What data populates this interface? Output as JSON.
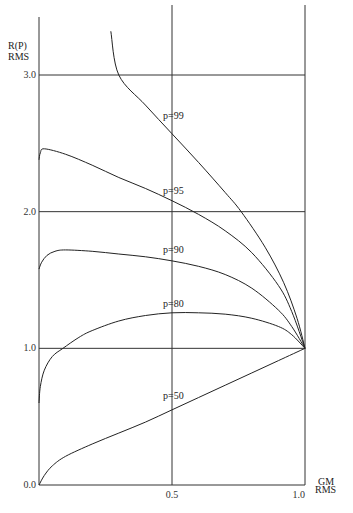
{
  "chart_data": {
    "type": "line",
    "title": "",
    "xlabel": "GM RMS",
    "xlabel_lines": [
      "GM",
      "RMS"
    ],
    "ylabel": "R(P) RMS",
    "ylabel_lines": [
      "R(P)",
      "RMS"
    ],
    "xlim": [
      0,
      1.0
    ],
    "ylim": [
      0,
      3.35
    ],
    "x_ticks": [
      {
        "value": 0.5,
        "label": "0.5"
      },
      {
        "value": 1.0,
        "label": "1.0"
      }
    ],
    "y_ticks": [
      {
        "value": 0.0,
        "label": "0.0"
      },
      {
        "value": 1.0,
        "label": "1.0"
      },
      {
        "value": 2.0,
        "label": "2.0"
      },
      {
        "value": 3.0,
        "label": "3.0"
      }
    ],
    "grid": true,
    "legend": "none (inline curve labels)",
    "series": [
      {
        "name": "p=99",
        "label": "p=99",
        "label_at": [
          0.5,
          2.68
        ],
        "x": [
          0.27,
          0.3,
          0.4,
          0.5,
          0.6,
          0.7,
          0.76,
          0.85,
          0.92,
          0.97,
          1.0
        ],
        "y": [
          3.32,
          3.0,
          2.78,
          2.57,
          2.36,
          2.14,
          2.0,
          1.74,
          1.48,
          1.22,
          1.0
        ]
      },
      {
        "name": "p=95",
        "label": "p=95",
        "label_at": [
          0.5,
          2.13
        ],
        "x": [
          0.0,
          0.005,
          0.02,
          0.1,
          0.2,
          0.3,
          0.4,
          0.5,
          0.6,
          0.7,
          0.8,
          0.9,
          0.95,
          1.0
        ],
        "y": [
          2.38,
          2.43,
          2.46,
          2.42,
          2.34,
          2.25,
          2.17,
          2.08,
          1.98,
          1.86,
          1.7,
          1.46,
          1.27,
          1.0
        ]
      },
      {
        "name": "p=90",
        "label": "p=90",
        "label_at": [
          0.5,
          1.7
        ],
        "x": [
          0.0,
          0.01,
          0.03,
          0.06,
          0.1,
          0.2,
          0.3,
          0.4,
          0.5,
          0.6,
          0.7,
          0.8,
          0.9,
          0.95,
          1.0
        ],
        "y": [
          1.58,
          1.63,
          1.68,
          1.71,
          1.72,
          1.71,
          1.69,
          1.67,
          1.64,
          1.6,
          1.54,
          1.44,
          1.28,
          1.16,
          1.0
        ]
      },
      {
        "name": "p=80",
        "label": "p=80",
        "label_at": [
          0.5,
          1.3
        ],
        "x": [
          0.0,
          0.005,
          0.02,
          0.05,
          0.09,
          0.15,
          0.2,
          0.3,
          0.4,
          0.5,
          0.6,
          0.7,
          0.8,
          0.9,
          0.95,
          1.0
        ],
        "y": [
          0.6,
          0.72,
          0.84,
          0.94,
          1.0,
          1.08,
          1.13,
          1.2,
          1.24,
          1.26,
          1.26,
          1.25,
          1.22,
          1.16,
          1.1,
          1.0
        ]
      },
      {
        "name": "p=50",
        "label": "p=50",
        "label_at": [
          0.5,
          0.63
        ],
        "x": [
          0.0,
          0.02,
          0.05,
          0.1,
          0.2,
          0.3,
          0.4,
          0.5,
          0.6,
          0.7,
          0.8,
          0.9,
          1.0
        ],
        "y": [
          0.0,
          0.07,
          0.14,
          0.21,
          0.3,
          0.38,
          0.46,
          0.55,
          0.64,
          0.73,
          0.82,
          0.91,
          1.0
        ]
      }
    ]
  }
}
